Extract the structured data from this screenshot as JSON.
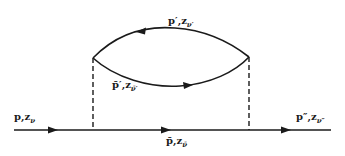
{
  "diagram": {
    "type": "feynman-self-energy",
    "colors": {
      "line": "#1a1a1a",
      "background": "#ffffff"
    },
    "labels": {
      "incoming": {
        "momentum": "p",
        "prime": ",",
        "z": "z",
        "sub": "ν"
      },
      "outgoing": {
        "momentum": "p″",
        "prime": ",",
        "z": "z",
        "sub": "ν″"
      },
      "intermediate": {
        "momentum": "p̄",
        "prime": ",",
        "z": "z",
        "sub": "ν̄"
      },
      "loop_upper": {
        "momentum": "p′",
        "prime": ",",
        "z": "z",
        "sub": "ν′"
      },
      "loop_lower": {
        "momentum": "p̄′",
        "prime": ",",
        "z": "z",
        "sub": "ν̄′"
      }
    },
    "edges": [
      {
        "id": "incoming",
        "style": "solid",
        "direction": "right"
      },
      {
        "id": "intermediate",
        "style": "solid",
        "direction": "right"
      },
      {
        "id": "outgoing",
        "style": "solid",
        "direction": "right"
      },
      {
        "id": "loop_upper",
        "style": "solid-arc",
        "direction": "left"
      },
      {
        "id": "loop_lower",
        "style": "solid-arc",
        "direction": "right"
      },
      {
        "id": "interaction_left",
        "style": "dashed"
      },
      {
        "id": "interaction_right",
        "style": "dashed"
      }
    ]
  }
}
